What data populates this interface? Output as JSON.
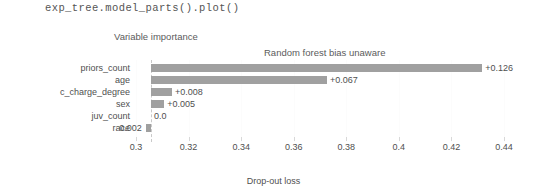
{
  "code_cell": {
    "text": "exp_tree.model_parts().plot()"
  },
  "chart_data": {
    "type": "bar",
    "title": "Variable importance",
    "subtitle": "Random forest bias unaware",
    "xlabel": "Drop-out loss",
    "ylabel": "",
    "orientation": "horizontal",
    "grid": true,
    "legend": "none",
    "bar_color": "#a0a0a0",
    "reference_line_value": 0.3057,
    "xlim": [
      0.2905,
      0.4495
    ],
    "xticks": [
      0.3,
      0.32,
      0.34,
      0.36,
      0.38,
      0.4,
      0.42,
      0.44
    ],
    "xtick_labels": [
      "0.3",
      "0.32",
      "0.34",
      "0.36",
      "0.38",
      "0.4",
      "0.42",
      "0.44"
    ],
    "categories": [
      "priors_count",
      "age",
      "c_charge_degree",
      "sex",
      "juv_count",
      "race"
    ],
    "values": [
      0.126,
      0.067,
      0.008,
      0.005,
      0.0,
      -0.002
    ],
    "bar_end_values": [
      0.4317,
      0.3727,
      0.3137,
      0.3107,
      0.3057,
      0.3037
    ],
    "data_labels": [
      "+0.126",
      "+0.067",
      "+0.008",
      "+0.005",
      "0.0",
      "0.002"
    ],
    "label_side": [
      "right",
      "right",
      "right",
      "right",
      "right",
      "left"
    ]
  }
}
